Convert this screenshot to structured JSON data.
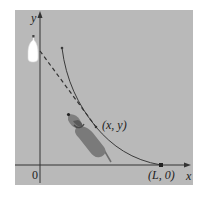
{
  "figure": {
    "axes": {
      "x_label": "x",
      "y_label": "y",
      "origin_label": "0"
    },
    "points": {
      "curve_point_label": "(x, y)",
      "end_point_label": "(L, 0)"
    },
    "elements": {
      "curve": "pursuit-curve",
      "tangent": "dashed-tangent-line",
      "target": "bottle",
      "pursuer": "dog"
    },
    "colors": {
      "background": "#b9b9b9",
      "axis": "#333333",
      "curve": "#3a3a3a",
      "dog_body": "#7a7a7a",
      "bottle": "#ffffff"
    }
  }
}
